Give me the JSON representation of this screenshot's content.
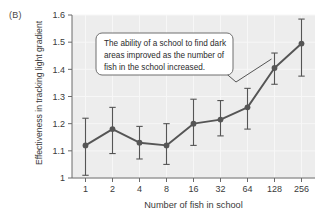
{
  "figure": {
    "panel_label": "(B)"
  },
  "chart_data": {
    "type": "line",
    "title": "",
    "subtitle": "",
    "xlabel": "Number of fish in school",
    "ylabel": "Effectiveness in tracking light gradient",
    "categories": [
      "1",
      "2",
      "4",
      "8",
      "16",
      "32",
      "64",
      "128",
      "256"
    ],
    "x": [
      1,
      2,
      4,
      8,
      16,
      32,
      64,
      128,
      256
    ],
    "x_scale": "log2-categorical",
    "values": [
      1.12,
      1.18,
      1.13,
      1.12,
      1.2,
      1.215,
      1.26,
      1.405,
      1.495
    ],
    "error_low": [
      1.01,
      1.09,
      1.07,
      1.05,
      1.12,
      1.155,
      1.18,
      1.345,
      1.375
    ],
    "error_high": [
      1.22,
      1.26,
      1.19,
      1.2,
      1.29,
      1.285,
      1.33,
      1.46,
      1.585
    ],
    "ylim": [
      1.0,
      1.6
    ],
    "yticks": [
      1,
      1.1,
      1.2,
      1.3,
      1.4,
      1.5,
      1.6
    ],
    "ytick_labels": [
      "1",
      "1.1",
      "1.2",
      "1.3",
      "1.4",
      "1.5",
      "1.6"
    ],
    "grid": true,
    "legend": "none",
    "series_color": "#555555",
    "plot_background": "#ededed",
    "gridline_color": "#f7f7f7",
    "annotations": [
      {
        "name": "callout",
        "lines": [
          "The ability of a school to find dark",
          "areas improved as the number of",
          "fish in the school increased."
        ],
        "text": "The ability of a school to find dark areas improved as the number of fish in the school increased.",
        "points_to": "128"
      }
    ]
  }
}
